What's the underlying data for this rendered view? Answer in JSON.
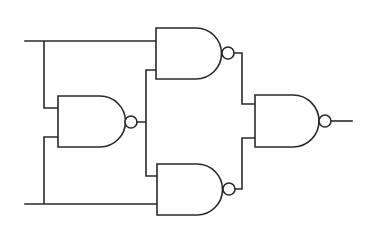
{
  "diagram": {
    "type": "logic-circuit",
    "colors": {
      "line": "#2a2a2a",
      "background": "#ffffff"
    },
    "inputs": [
      {
        "id": "input-a",
        "y": 41
      },
      {
        "id": "input-b",
        "y": 204
      }
    ],
    "gates": [
      {
        "id": "nand-middle-left",
        "kind": "NAND",
        "x": 58,
        "top": 96,
        "bottom": 147
      },
      {
        "id": "nand-top",
        "kind": "NAND",
        "x": 156,
        "top": 28,
        "bottom": 79
      },
      {
        "id": "nand-bottom",
        "kind": "NAND",
        "x": 157,
        "top": 164,
        "bottom": 215
      },
      {
        "id": "nand-output",
        "kind": "NAND",
        "x": 255,
        "top": 95,
        "bottom": 147
      }
    ],
    "output": {
      "id": "output",
      "x_end": 352,
      "y": 121
    }
  }
}
